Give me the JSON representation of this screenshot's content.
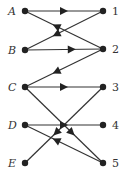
{
  "diagram": {
    "type": "bipartite-directed-graph",
    "left_nodes": [
      {
        "id": "A",
        "label": "A",
        "x": 25,
        "y": 11
      },
      {
        "id": "B",
        "label": "B",
        "x": 25,
        "y": 50
      },
      {
        "id": "C",
        "label": "C",
        "x": 25,
        "y": 87
      },
      {
        "id": "D",
        "label": "D",
        "x": 25,
        "y": 125
      },
      {
        "id": "E",
        "label": "E",
        "x": 25,
        "y": 163
      }
    ],
    "right_nodes": [
      {
        "id": "1",
        "label": "1",
        "x": 103,
        "y": 11
      },
      {
        "id": "2",
        "label": "2",
        "x": 103,
        "y": 49
      },
      {
        "id": "3",
        "label": "3",
        "x": 103,
        "y": 87
      },
      {
        "id": "4",
        "label": "4",
        "x": 103,
        "y": 125
      },
      {
        "id": "5",
        "label": "5",
        "x": 103,
        "y": 163
      }
    ],
    "edges": [
      {
        "from": "A",
        "to": "1"
      },
      {
        "from": "1",
        "to": "B"
      },
      {
        "from": "2",
        "to": "A"
      },
      {
        "from": "B",
        "to": "2"
      },
      {
        "from": "2",
        "to": "C"
      },
      {
        "from": "C",
        "to": "3"
      },
      {
        "from": "C",
        "to": "5"
      },
      {
        "from": "3",
        "to": "E"
      },
      {
        "from": "D",
        "to": "4"
      },
      {
        "from": "5",
        "to": "D"
      }
    ],
    "colors": {
      "line": "#333333",
      "node": "#222222",
      "label": "#333333"
    }
  }
}
